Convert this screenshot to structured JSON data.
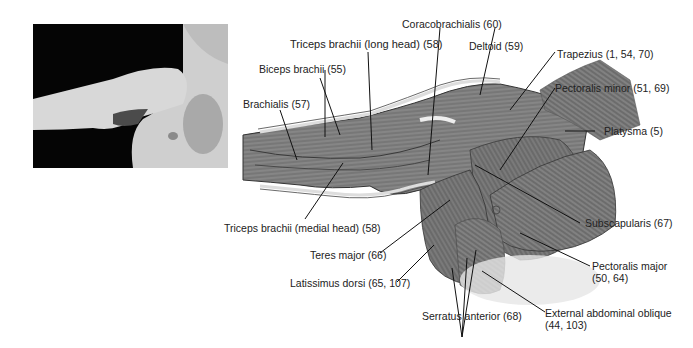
{
  "photo": {
    "description": "Photograph of raised arm and chest"
  },
  "labels": {
    "coracobrachialis": "Coracobrachialis (60)",
    "triceps_long": "Triceps brachii (long head) (58)",
    "deltoid": "Deltoid (59)",
    "trapezius": "Trapezius (1, 54, 70)",
    "biceps": "Biceps brachii (55)",
    "pectoralis_minor": "Pectoralis minor (51, 69)",
    "brachialis": "Brachialis (57)",
    "platysma": "Platysma (5)",
    "triceps_medial": "Triceps brachii (medial head) (58)",
    "subscapularis": "Subscapularis (67)",
    "teres_major": "Teres major (66)",
    "pectoralis_major_1": "Pectoralis major",
    "pectoralis_major_2": "(50, 64)",
    "latissimus": "Latissimus dorsi (65, 107)",
    "serratus": "Serratus anterior (68)",
    "ext_oblique_1": "External abdominal oblique",
    "ext_oblique_2": "(44, 103)"
  },
  "colors": {
    "muscle": "#6e6e6e",
    "muscle_dark": "#4a4a4a",
    "muscle_light": "#a8a8a8",
    "line": "#111111"
  }
}
